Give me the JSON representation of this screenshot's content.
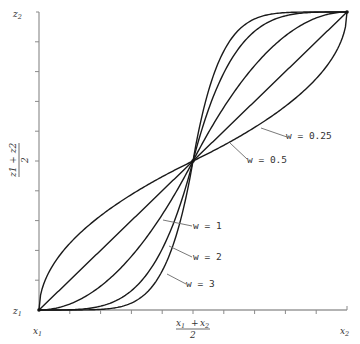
{
  "chart_data": {
    "type": "line",
    "title": "",
    "xlabel": "",
    "ylabel": "",
    "x_ticks": [
      "x1",
      "(x1 + x2)/2",
      "x2"
    ],
    "y_ticks": [
      "z1",
      "(z1 + z2)/2",
      "z2"
    ],
    "x_tick_count": 10,
    "y_tick_count": 10,
    "xlim": [
      0,
      1
    ],
    "ylim": [
      0,
      1
    ],
    "grid": false,
    "legend": "inline leader labels",
    "series": [
      {
        "name": "w = 0.25",
        "exponent": 0.5,
        "label": "w = 0.25"
      },
      {
        "name": "w = 0.5",
        "exponent": 1,
        "label": "w = 0.5"
      },
      {
        "name": "w = 1",
        "exponent": 2,
        "label": "w = 1"
      },
      {
        "name": "w = 2",
        "exponent": 4,
        "label": "w = 2"
      },
      {
        "name": "w = 3",
        "exponent": 6,
        "label": "w = 3"
      }
    ]
  },
  "labels": {
    "x_left": "x",
    "x_left_sub": "1",
    "x_right": "x",
    "x_right_sub": "2",
    "x_mid_num_a": "x",
    "x_mid_num_a_sub": "1",
    "x_mid_plus": "+",
    "x_mid_num_b": "x",
    "x_mid_num_b_sub": "2",
    "x_mid_den": "2",
    "y_bottom": "z",
    "y_bottom_sub": "1",
    "y_top": "z",
    "y_top_sub": "2",
    "y_mid": "z1 + z2",
    "y_mid_den": "2",
    "w025": "w = 0.25",
    "w05": "w = 0.5",
    "w1": "w = 1",
    "w2": "w = 2",
    "w3": "w = 3"
  }
}
